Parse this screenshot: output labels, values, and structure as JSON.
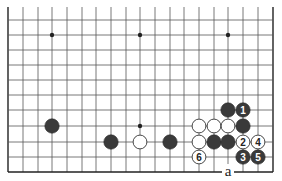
{
  "diagram": {
    "type": "go-board-partial",
    "view": "lower edge of 19x19 board, top rows cropped",
    "grid": {
      "columns_x": [
        8,
        23,
        38,
        52,
        67,
        82,
        96,
        111,
        126,
        140,
        155,
        170,
        184,
        199,
        214,
        228,
        243,
        258,
        273
      ],
      "rows_y": [
        20,
        35,
        50,
        65,
        80,
        95,
        110,
        126,
        142,
        157,
        172
      ],
      "line_top_y": 7,
      "line_color": "#555555",
      "edge_color": "#222222"
    },
    "star_points": [
      {
        "x": 52,
        "y": 35
      },
      {
        "x": 140,
        "y": 35
      },
      {
        "x": 228,
        "y": 35
      },
      {
        "x": 140,
        "y": 126
      }
    ],
    "stones": [
      {
        "color": "black",
        "x": 52,
        "y": 126,
        "label": ""
      },
      {
        "color": "black",
        "x": 111,
        "y": 142,
        "label": ""
      },
      {
        "color": "white",
        "x": 140,
        "y": 142,
        "label": ""
      },
      {
        "color": "black",
        "x": 170,
        "y": 142,
        "label": ""
      },
      {
        "color": "black",
        "x": 228,
        "y": 110,
        "label": ""
      },
      {
        "color": "black",
        "x": 243,
        "y": 110,
        "label": "1"
      },
      {
        "color": "white",
        "x": 199,
        "y": 126,
        "label": ""
      },
      {
        "color": "white",
        "x": 214,
        "y": 126,
        "label": ""
      },
      {
        "color": "white",
        "x": 228,
        "y": 126,
        "label": ""
      },
      {
        "color": "black",
        "x": 243,
        "y": 126,
        "label": ""
      },
      {
        "color": "white",
        "x": 199,
        "y": 142,
        "label": ""
      },
      {
        "color": "black",
        "x": 214,
        "y": 142,
        "label": ""
      },
      {
        "color": "black",
        "x": 228,
        "y": 142,
        "label": ""
      },
      {
        "color": "white",
        "x": 243,
        "y": 142,
        "label": "2"
      },
      {
        "color": "white",
        "x": 258,
        "y": 142,
        "label": "4"
      },
      {
        "color": "white",
        "x": 199,
        "y": 157,
        "label": "6"
      },
      {
        "color": "black",
        "x": 243,
        "y": 157,
        "label": "3"
      },
      {
        "color": "black",
        "x": 258,
        "y": 157,
        "label": "5"
      }
    ],
    "point_labels": [
      {
        "text": "a",
        "x": 228,
        "y": 172
      }
    ],
    "colors": {
      "black_stone": "#3a3a3a",
      "white_stone": "#ffffff",
      "stone_outline": "#333333",
      "background": "#ffffff"
    }
  }
}
